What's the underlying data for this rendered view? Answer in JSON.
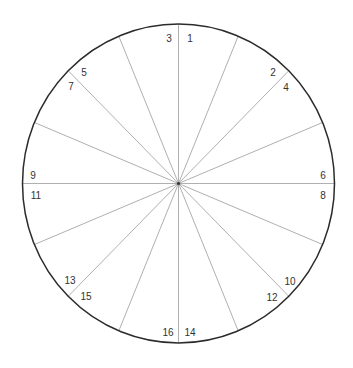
{
  "diagram": {
    "type": "wheel",
    "center": {
      "x": 178.5,
      "y": 183.5
    },
    "radius_x": 156,
    "radius_y": 159.5,
    "spoke_count": 16,
    "spoke_angle_step_deg": 22.5,
    "colors": {
      "rim": "#2b2b2b",
      "spoke": "#b0b0b0",
      "label": "#333333",
      "background": "#ffffff"
    },
    "labels": [
      {
        "text": "1",
        "x": 190,
        "y": 39
      },
      {
        "text": "3",
        "x": 169,
        "y": 39
      },
      {
        "text": "2",
        "x": 273,
        "y": 73
      },
      {
        "text": "4",
        "x": 286,
        "y": 88
      },
      {
        "text": "5",
        "x": 84,
        "y": 73
      },
      {
        "text": "7",
        "x": 71,
        "y": 87
      },
      {
        "text": "6",
        "x": 323,
        "y": 176
      },
      {
        "text": "8",
        "x": 323,
        "y": 196
      },
      {
        "text": "9",
        "x": 33,
        "y": 176
      },
      {
        "text": "11",
        "x": 36,
        "y": 196
      },
      {
        "text": "10",
        "x": 290,
        "y": 282
      },
      {
        "text": "12",
        "x": 272,
        "y": 298
      },
      {
        "text": "13",
        "x": 70,
        "y": 281
      },
      {
        "text": "15",
        "x": 86,
        "y": 297
      },
      {
        "text": "16",
        "x": 168,
        "y": 333
      },
      {
        "text": "14",
        "x": 190,
        "y": 333
      }
    ]
  }
}
